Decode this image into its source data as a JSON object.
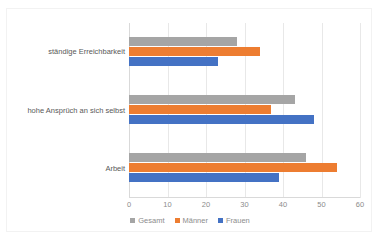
{
  "title_partial": "",
  "chart_data": {
    "type": "bar",
    "orientation": "horizontal",
    "title": "",
    "xlabel": "",
    "ylabel": "",
    "xlim": [
      0,
      60
    ],
    "xticks": [
      "0",
      "10",
      "20",
      "30",
      "40",
      "50",
      "60"
    ],
    "grid": true,
    "legend_position": "bottom",
    "categories": [
      "ständige Erreichbarkeit",
      "hohe Ansprüch an sich selbst",
      "Arbeit"
    ],
    "series": [
      {
        "name": "Gesamt",
        "color": "#A5A5A5",
        "values": [
          28,
          43,
          46
        ]
      },
      {
        "name": "Männer",
        "color": "#ED7D31",
        "values": [
          34,
          37,
          54
        ]
      },
      {
        "name": "Frauen",
        "color": "#4472C4",
        "values": [
          23,
          48,
          39
        ]
      }
    ]
  },
  "legend": {
    "items": [
      {
        "label": "Gesamt",
        "color": "#A5A5A5"
      },
      {
        "label": "Männer",
        "color": "#ED7D31"
      },
      {
        "label": "Frauen",
        "color": "#4472C4"
      }
    ]
  }
}
